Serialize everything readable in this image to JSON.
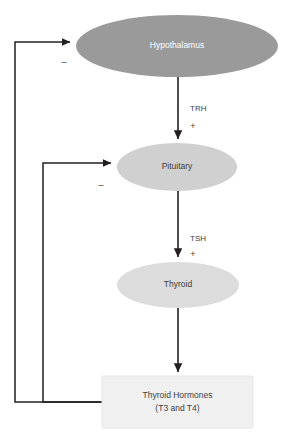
{
  "diagram": {
    "type": "flow-diagram",
    "nodes": [
      {
        "id": "hypothalamus",
        "label": "Hypothalamus",
        "shape": "ellipse",
        "fill": "#9a9a9a",
        "text_color": "#ffffff",
        "cx": 177,
        "cy": 46,
        "rx": 101,
        "ry": 31
      },
      {
        "id": "pituitary",
        "label": "Pituitary",
        "shape": "ellipse",
        "fill": "#d0d0d0",
        "text_color": "#3d3d3d",
        "cx": 177,
        "cy": 167,
        "rx": 60,
        "ry": 24
      },
      {
        "id": "thyroid",
        "label": "Thyroid",
        "shape": "ellipse",
        "fill": "#dcdcdc",
        "text_color": "#3d3d3d",
        "cx": 178,
        "cy": 285,
        "rx": 61,
        "ry": 23
      },
      {
        "id": "thyroid-hormones",
        "label_line1": "Thyroid Hormones",
        "label_line2": "(T3 and T4)",
        "shape": "rect",
        "fill": "#f0f0f0",
        "stroke": "#e0e0e0",
        "text_color": "#3d3d3d",
        "x": 102,
        "y": 376,
        "width": 151,
        "height": 52
      }
    ],
    "edges": [
      {
        "id": "trh-edge",
        "from": "hypothalamus",
        "to": "pituitary",
        "label": "TRH",
        "sign": "+",
        "effect": "stimulatory",
        "label_x": 190,
        "label_y": 111,
        "sign_x": 193,
        "sign_y": 127
      },
      {
        "id": "tsh-edge",
        "from": "pituitary",
        "to": "thyroid",
        "label": "TSH",
        "sign": "+",
        "effect": "stimulatory",
        "label_x": 190,
        "label_y": 241,
        "sign_x": 193,
        "sign_y": 255
      },
      {
        "id": "thyroid-to-hormones-edge",
        "from": "thyroid",
        "to": "thyroid-hormones",
        "label": "",
        "sign": "",
        "effect": "production"
      },
      {
        "id": "feedback-hypothalamus-edge",
        "from": "thyroid-hormones",
        "to": "hypothalamus",
        "label": "",
        "sign": "–",
        "effect": "inhibitory",
        "sign_x": 64,
        "sign_y": 63
      },
      {
        "id": "feedback-pituitary-edge",
        "from": "thyroid-hormones",
        "to": "pituitary",
        "label": "",
        "sign": "–",
        "effect": "inhibitory",
        "sign_x": 101,
        "sign_y": 186
      }
    ],
    "colors": {
      "line": "#231f20",
      "background": "#ffffff",
      "hypothalamus_fill": "#9a9a9a",
      "pituitary_fill": "#d0d0d0",
      "thyroid_fill": "#dcdcdc",
      "box_fill": "#f0f0f0"
    }
  }
}
